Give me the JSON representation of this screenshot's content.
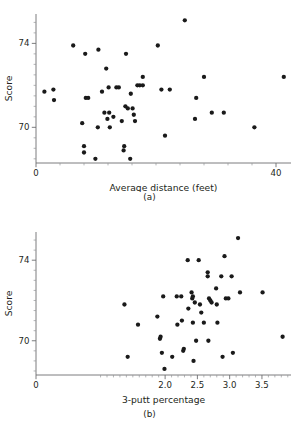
{
  "figure": {
    "panels": [
      {
        "id": "a",
        "panel_label": "(a)",
        "xlabel": "Average distance (feet)",
        "ylabel": "Score"
      },
      {
        "id": "b",
        "panel_label": "(b)",
        "xlabel": "3-putt percentage",
        "ylabel": "Score"
      }
    ]
  },
  "chart_data": [
    {
      "type": "scatter",
      "panel": "(a)",
      "title": "",
      "xlabel": "Average distance (feet)",
      "ylabel": "Score",
      "xlim": [
        0,
        42.5
      ],
      "ylim": [
        68.3,
        75.4
      ],
      "xticks": [
        0,
        40
      ],
      "xtick_labels": [
        "0",
        "40"
      ],
      "xticks_minor": [
        4,
        8,
        12,
        16,
        20,
        24,
        28,
        32,
        36
      ],
      "yticks": [
        70,
        74
      ],
      "ytick_labels": [
        "70",
        "74"
      ],
      "yticks_minor": [
        68.5,
        69,
        69.5,
        70.5,
        71,
        71.5,
        72,
        72.5,
        73,
        73.5,
        74.5,
        75
      ],
      "grid": false,
      "legend": null,
      "marker_color": "#1a1a1a",
      "points": [
        [
          1.4,
          71.7
        ],
        [
          2.9,
          71.8
        ],
        [
          3.0,
          71.3
        ],
        [
          6.2,
          73.9
        ],
        [
          7.7,
          70.2
        ],
        [
          8.0,
          69.1
        ],
        [
          8.0,
          68.8
        ],
        [
          8.2,
          73.5
        ],
        [
          8.3,
          71.4
        ],
        [
          8.7,
          71.4
        ],
        [
          9.9,
          68.5
        ],
        [
          10.3,
          70.0
        ],
        [
          10.4,
          73.7
        ],
        [
          11.0,
          71.7
        ],
        [
          11.4,
          70.7
        ],
        [
          11.7,
          72.8
        ],
        [
          11.9,
          70.4
        ],
        [
          12.1,
          71.9
        ],
        [
          12.2,
          70.7
        ],
        [
          12.3,
          70.0
        ],
        [
          12.9,
          70.5
        ],
        [
          13.4,
          71.9
        ],
        [
          13.8,
          71.9
        ],
        [
          14.3,
          70.3
        ],
        [
          14.6,
          68.9
        ],
        [
          14.7,
          69.1
        ],
        [
          14.9,
          71.0
        ],
        [
          15.0,
          73.5
        ],
        [
          15.3,
          70.9
        ],
        [
          15.7,
          68.5
        ],
        [
          15.8,
          71.6
        ],
        [
          16.1,
          70.9
        ],
        [
          16.3,
          70.6
        ],
        [
          16.5,
          70.3
        ],
        [
          16.9,
          72.0
        ],
        [
          17.3,
          72.0
        ],
        [
          17.8,
          72.0
        ],
        [
          17.8,
          72.4
        ],
        [
          20.3,
          73.9
        ],
        [
          20.9,
          71.8
        ],
        [
          21.5,
          69.6
        ],
        [
          22.3,
          71.8
        ],
        [
          24.8,
          75.1
        ],
        [
          26.5,
          70.4
        ],
        [
          26.7,
          71.4
        ],
        [
          28.0,
          72.4
        ],
        [
          29.3,
          70.7
        ],
        [
          31.3,
          70.7
        ],
        [
          36.4,
          70.0
        ],
        [
          41.3,
          72.4
        ]
      ]
    },
    {
      "type": "scatter",
      "panel": "(b)",
      "title": "",
      "xlabel": "3-putt percentage",
      "ylabel": "Score",
      "xlim": [
        0,
        3.95
      ],
      "ylim": [
        68.3,
        75.4
      ],
      "xticks": [
        0,
        2.0,
        2.5,
        3.0,
        3.5
      ],
      "xtick_labels": [
        "0",
        "2.0",
        "2.5",
        "3.0",
        "3.5"
      ],
      "xticks_minor": [
        1.0,
        1.1,
        1.2,
        1.3,
        1.4,
        1.5,
        1.6,
        1.7,
        1.8,
        1.9,
        2.1,
        2.2,
        2.3,
        2.4,
        2.6,
        2.7,
        2.8,
        2.9,
        3.1,
        3.2,
        3.3,
        3.4,
        3.6,
        3.7,
        3.8,
        3.9
      ],
      "yticks": [
        70,
        74
      ],
      "ytick_labels": [
        "70",
        "74"
      ],
      "yticks_minor": [
        68.5,
        69,
        69.5,
        70.5,
        71,
        71.5,
        72,
        72.5,
        73,
        73.5,
        74.5,
        75
      ],
      "grid": false,
      "legend": null,
      "marker_color": "#1a1a1a",
      "points": [
        [
          1.37,
          71.8
        ],
        [
          1.42,
          69.2
        ],
        [
          1.58,
          70.8
        ],
        [
          1.88,
          71.2
        ],
        [
          1.92,
          70.1
        ],
        [
          1.93,
          70.2
        ],
        [
          1.95,
          69.4
        ],
        [
          1.97,
          72.2
        ],
        [
          1.99,
          68.6
        ],
        [
          2.11,
          69.2
        ],
        [
          2.18,
          72.2
        ],
        [
          2.19,
          70.8
        ],
        [
          2.25,
          72.2
        ],
        [
          2.26,
          71.0
        ],
        [
          2.28,
          69.5
        ],
        [
          2.29,
          69.6
        ],
        [
          2.35,
          74.0
        ],
        [
          2.36,
          71.6
        ],
        [
          2.41,
          72.4
        ],
        [
          2.42,
          72.1
        ],
        [
          2.43,
          72.2
        ],
        [
          2.43,
          70.9
        ],
        [
          2.44,
          69.0
        ],
        [
          2.46,
          71.9
        ],
        [
          2.48,
          70.0
        ],
        [
          2.52,
          74.0
        ],
        [
          2.54,
          71.8
        ],
        [
          2.56,
          71.4
        ],
        [
          2.6,
          70.9
        ],
        [
          2.66,
          73.2
        ],
        [
          2.66,
          73.4
        ],
        [
          2.67,
          70.0
        ],
        [
          2.68,
          72.1
        ],
        [
          2.7,
          72.0
        ],
        [
          2.72,
          71.9
        ],
        [
          2.79,
          72.6
        ],
        [
          2.8,
          71.8
        ],
        [
          2.81,
          70.9
        ],
        [
          2.87,
          73.2
        ],
        [
          2.89,
          69.2
        ],
        [
          2.92,
          74.2
        ],
        [
          2.94,
          72.1
        ],
        [
          2.98,
          72.1
        ],
        [
          3.03,
          73.2
        ],
        [
          3.05,
          69.4
        ],
        [
          3.13,
          75.1
        ],
        [
          3.16,
          72.4
        ],
        [
          3.51,
          72.4
        ],
        [
          3.82,
          70.2
        ]
      ]
    }
  ]
}
